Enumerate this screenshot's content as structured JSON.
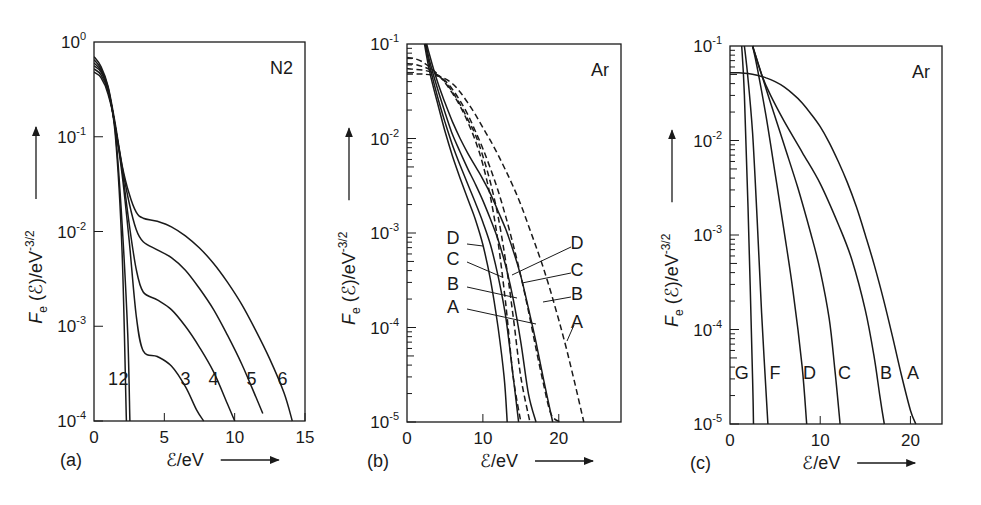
{
  "chart_data": [
    {
      "id": "a",
      "panel_label": "(a)",
      "type": "line",
      "title": "N2",
      "xlabel": "ℰ/eV",
      "ylabel": "Fe(ℰ)/eV^-3/2",
      "xscale": "linear",
      "yscale": "log",
      "xlim": [
        0,
        15
      ],
      "ylim": [
        0.0001,
        1
      ],
      "xticks": [
        0,
        5,
        10,
        15
      ],
      "xtick_labels": [
        "0",
        "5",
        "10",
        "15"
      ],
      "yticks": [
        1,
        0.1,
        0.01,
        0.001,
        0.0001
      ],
      "ytick_labels": [
        [
          "10",
          "0"
        ],
        [
          "10",
          "-1"
        ],
        [
          "10",
          "-2"
        ],
        [
          "10",
          "-3"
        ],
        [
          "10",
          "-4"
        ]
      ],
      "frame": {
        "x0": 94,
        "x1": 305,
        "y0": 42,
        "y1": 421
      },
      "series": [
        {
          "name": "1",
          "style": "solid",
          "label_pos": [
            1.35,
            0.00028
          ],
          "x": [
            0,
            0.5,
            1.0,
            1.5,
            2.0,
            2.3
          ],
          "y": [
            0.48,
            0.42,
            0.28,
            0.11,
            0.006,
            0.0001
          ]
        },
        {
          "name": "2",
          "style": "solid",
          "label_pos": [
            2.1,
            0.00028
          ],
          "x": [
            0,
            0.5,
            1.0,
            1.5,
            2.0,
            2.4,
            2.55
          ],
          "y": [
            0.52,
            0.45,
            0.3,
            0.12,
            0.012,
            0.0008,
            0.0001
          ]
        },
        {
          "name": "3",
          "style": "solid",
          "label_pos": [
            6.5,
            0.00028
          ],
          "x": [
            0,
            0.5,
            1.0,
            1.5,
            2.0,
            2.5,
            3.0,
            3.5,
            4.5,
            5.5,
            6.5,
            7.3,
            7.8
          ],
          "y": [
            0.56,
            0.48,
            0.31,
            0.13,
            0.04,
            0.008,
            0.0013,
            0.00055,
            0.00048,
            0.00038,
            0.00023,
            0.00013,
            0.0001
          ]
        },
        {
          "name": "4",
          "style": "solid",
          "label_pos": [
            8.5,
            0.00028
          ],
          "x": [
            0,
            0.5,
            1.0,
            1.5,
            2.0,
            2.5,
            3.0,
            3.5,
            4.5,
            5.5,
            6.5,
            7.5,
            8.5,
            9.5,
            10.0
          ],
          "y": [
            0.6,
            0.5,
            0.32,
            0.13,
            0.045,
            0.012,
            0.004,
            0.0023,
            0.0019,
            0.0015,
            0.001,
            0.0006,
            0.00033,
            0.00015,
            0.0001
          ]
        },
        {
          "name": "5",
          "style": "solid",
          "label_pos": [
            11.2,
            0.00028
          ],
          "x": [
            0,
            0.5,
            1.0,
            1.5,
            2.0,
            2.5,
            3.0,
            3.5,
            4.5,
            5.5,
            6.5,
            7.5,
            8.5,
            9.5,
            10.5,
            11.5,
            12.0
          ],
          "y": [
            0.65,
            0.52,
            0.33,
            0.13,
            0.048,
            0.02,
            0.0105,
            0.0078,
            0.0064,
            0.0053,
            0.0039,
            0.0025,
            0.0015,
            0.0008,
            0.0004,
            0.00018,
            0.00012
          ]
        },
        {
          "name": "6",
          "style": "solid",
          "label_pos": [
            13.4,
            0.00028
          ],
          "x": [
            0,
            0.5,
            1.0,
            1.5,
            2.0,
            2.5,
            3.0,
            3.5,
            4.5,
            5.5,
            6.5,
            7.5,
            8.5,
            9.5,
            10.5,
            11.5,
            12.5,
            13.5,
            14.1
          ],
          "y": [
            0.7,
            0.55,
            0.34,
            0.14,
            0.05,
            0.025,
            0.016,
            0.0138,
            0.0128,
            0.0112,
            0.009,
            0.0067,
            0.0046,
            0.0029,
            0.0017,
            0.0009,
            0.00045,
            0.0002,
            0.0001
          ]
        }
      ]
    },
    {
      "id": "b",
      "panel_label": "(b)",
      "type": "line",
      "title": "Ar",
      "xlabel": "ℰ/eV",
      "ylabel": "Fe(ℰ)/eV^-3/2",
      "xscale": "linear",
      "yscale": "log",
      "xlim": [
        0,
        28.2
      ],
      "ylim": [
        1e-05,
        0.1
      ],
      "xticks": [
        0,
        10,
        20
      ],
      "xtick_labels": [
        "0",
        "10",
        "20"
      ],
      "yticks": [
        0.1,
        0.01,
        0.001,
        0.0001,
        1e-05
      ],
      "ytick_labels": [
        [
          "10",
          "-1"
        ],
        [
          "10",
          "-2"
        ],
        [
          "10",
          "-3"
        ],
        [
          "10",
          "-4"
        ],
        [
          "10",
          "-5"
        ]
      ],
      "frame": {
        "x0": 407,
        "x1": 621,
        "y0": 44,
        "y1": 422
      },
      "series": [
        {
          "name": "D",
          "style": "solid",
          "label_side": "left",
          "x": [
            2.3,
            3.0,
            4.0,
            5.0,
            6.0,
            7.0,
            8.0,
            9.0,
            10.0,
            11.0,
            12.0,
            12.8,
            13.2
          ],
          "y": [
            0.1,
            0.05,
            0.024,
            0.012,
            0.0065,
            0.0038,
            0.0023,
            0.0014,
            0.00075,
            0.00032,
            0.0001,
            3e-05,
            1e-05
          ]
        },
        {
          "name": "C",
          "style": "solid",
          "label_side": "left",
          "x": [
            2.4,
            3.0,
            4.0,
            5.0,
            6.0,
            7.0,
            8.0,
            9.0,
            10.0,
            11.0,
            12.0,
            13.0,
            14.0,
            14.7
          ],
          "y": [
            0.1,
            0.058,
            0.028,
            0.015,
            0.0085,
            0.0052,
            0.0033,
            0.0021,
            0.0013,
            0.00075,
            0.00035,
            0.00013,
            3e-05,
            1e-05
          ]
        },
        {
          "name": "B",
          "style": "solid",
          "label_side": "left",
          "x": [
            2.5,
            3.0,
            4.0,
            5.0,
            6.0,
            7.0,
            8.0,
            9.0,
            10.0,
            11.0,
            12.0,
            13.0,
            14.0,
            15.0,
            16.0,
            17.0
          ],
          "y": [
            0.1,
            0.065,
            0.034,
            0.019,
            0.011,
            0.0072,
            0.0048,
            0.0033,
            0.0022,
            0.0014,
            0.00085,
            0.00045,
            0.0002,
            7e-05,
            2e-05,
            1e-05
          ]
        },
        {
          "name": "A",
          "style": "solid",
          "label_side": "left",
          "x": [
            2.6,
            3.0,
            4.0,
            5.0,
            6.0,
            7.0,
            8.0,
            9.0,
            10.0,
            11.0,
            12.0,
            13.0,
            14.0,
            15.0,
            16.0,
            17.0,
            18.0,
            19.2
          ],
          "y": [
            0.1,
            0.075,
            0.04,
            0.024,
            0.015,
            0.01,
            0.007,
            0.0051,
            0.0037,
            0.0026,
            0.0017,
            0.0011,
            0.00065,
            0.00035,
            0.00016,
            7e-05,
            2.8e-05,
            1e-05
          ]
        },
        {
          "name": "D",
          "style": "dashed",
          "label_side": "right",
          "x": [
            0,
            1,
            2,
            3,
            4,
            5,
            6,
            7,
            8,
            9,
            10,
            11,
            12,
            13,
            14,
            15
          ],
          "y": [
            0.072,
            0.07,
            0.065,
            0.057,
            0.048,
            0.039,
            0.03,
            0.022,
            0.015,
            0.0095,
            0.0053,
            0.0024,
            0.0008,
            0.00018,
            3e-05,
            1e-05
          ]
        },
        {
          "name": "C",
          "style": "dashed",
          "label_side": "right",
          "x": [
            0,
            1,
            2,
            3,
            4,
            5,
            6,
            7,
            8,
            9,
            10,
            11,
            12,
            13,
            14,
            15,
            16.2
          ],
          "y": [
            0.062,
            0.061,
            0.058,
            0.054,
            0.047,
            0.04,
            0.031,
            0.023,
            0.016,
            0.011,
            0.0065,
            0.0034,
            0.0015,
            0.0005,
            0.00013,
            3e-05,
            1e-05
          ]
        },
        {
          "name": "B",
          "style": "dashed",
          "label_side": "right",
          "x": [
            0,
            1,
            2,
            3,
            4,
            5,
            6,
            7,
            8,
            9,
            10,
            11,
            12,
            13,
            14,
            15,
            16,
            17,
            18,
            19,
            20.2
          ],
          "y": [
            0.055,
            0.054,
            0.053,
            0.051,
            0.047,
            0.041,
            0.033,
            0.025,
            0.018,
            0.012,
            0.0078,
            0.0048,
            0.0028,
            0.0015,
            0.00075,
            0.00035,
            0.00015,
            6e-05,
            2.5e-05,
            1.2e-05,
            1e-05
          ]
        },
        {
          "name": "A",
          "style": "dashed",
          "label_side": "right",
          "x": [
            0,
            2,
            4,
            5,
            6,
            7,
            8,
            9,
            10,
            11,
            12,
            13,
            14,
            15,
            16,
            17,
            18,
            19,
            20,
            21,
            22,
            23.3
          ],
          "y": [
            0.048,
            0.048,
            0.046,
            0.043,
            0.038,
            0.031,
            0.024,
            0.018,
            0.013,
            0.0095,
            0.0067,
            0.0046,
            0.0031,
            0.002,
            0.0012,
            0.00072,
            0.00042,
            0.00023,
            0.00012,
            6e-05,
            2.8e-05,
            1e-05
          ]
        }
      ],
      "annotations": [
        {
          "text": "D",
          "x": 453,
          "y": 244,
          "line": [
            467,
            244,
            483,
            246
          ]
        },
        {
          "text": "C",
          "x": 453,
          "y": 265,
          "line": [
            467,
            262,
            502,
            277
          ]
        },
        {
          "text": "B",
          "x": 453,
          "y": 290,
          "line": [
            467,
            287,
            517,
            298
          ]
        },
        {
          "text": "A",
          "x": 453,
          "y": 313,
          "line": [
            467,
            309,
            536,
            324
          ]
        },
        {
          "text": "D",
          "x": 577,
          "y": 249,
          "line": [
            571,
            247,
            512,
            275
          ]
        },
        {
          "text": "C",
          "x": 577,
          "y": 276,
          "line": [
            571,
            273,
            522,
            283
          ]
        },
        {
          "text": "B",
          "x": 577,
          "y": 300,
          "line": [
            571,
            297,
            543,
            302
          ]
        },
        {
          "text": "A",
          "x": 577,
          "y": 328,
          "line": [
            574,
            325,
            567,
            341
          ]
        }
      ]
    },
    {
      "id": "c",
      "panel_label": "(c)",
      "type": "line",
      "title": "Ar",
      "xlabel": "ℰ/eV",
      "ylabel": "Fe(ℰ)/eV^-3/2",
      "xscale": "linear",
      "yscale": "log",
      "xlim": [
        0,
        23.5
      ],
      "ylim": [
        1e-05,
        0.1
      ],
      "xticks": [
        0,
        10,
        20
      ],
      "xtick_labels": [
        "0",
        "10",
        "20"
      ],
      "yticks": [
        0.1,
        0.01,
        0.001,
        0.0001,
        1e-05
      ],
      "ytick_labels": [
        [
          "10",
          "-1"
        ],
        [
          "10",
          "-2"
        ],
        [
          "10",
          "-3"
        ],
        [
          "10",
          "-4"
        ],
        [
          "10",
          "-5"
        ]
      ],
      "frame": {
        "x0": 730,
        "x1": 942,
        "y0": 46,
        "y1": 424
      },
      "series": [
        {
          "name": "G",
          "style": "solid",
          "label_pos": [
            1.3,
            3.5e-05
          ],
          "x": [
            1.3,
            1.6,
            2.0,
            2.5,
            2.6
          ],
          "y": [
            0.1,
            0.03,
            0.002,
            3e-05,
            1e-05
          ]
        },
        {
          "name": "F",
          "style": "solid",
          "label_pos": [
            5.0,
            3.5e-05
          ],
          "x": [
            1.6,
            2.0,
            2.5,
            3.0,
            3.5,
            4.2
          ],
          "y": [
            0.1,
            0.045,
            0.012,
            0.0015,
            0.00015,
            1e-05
          ]
        },
        {
          "name": "D",
          "style": "solid",
          "label_pos": [
            8.8,
            3.5e-05
          ],
          "x": [
            2.5,
            3.0,
            4.0,
            5.0,
            6.0,
            7.0,
            8.0,
            8.5
          ],
          "y": [
            0.1,
            0.06,
            0.018,
            0.0045,
            0.0011,
            0.00025,
            4e-05,
            1e-05
          ]
        },
        {
          "name": "C",
          "style": "solid",
          "label_pos": [
            12.7,
            3.5e-05
          ],
          "x": [
            2.5,
            3.5,
            4.5,
            6.0,
            7.5,
            9.0,
            10.0,
            11.0,
            11.6,
            12.2
          ],
          "y": [
            0.1,
            0.05,
            0.025,
            0.009,
            0.0032,
            0.001,
            0.00042,
            0.00013,
            4e-05,
            1e-05
          ]
        },
        {
          "name": "B",
          "style": "solid",
          "label_pos": [
            17.3,
            3.5e-05
          ],
          "x": [
            2.5,
            3.5,
            4.5,
            6.0,
            8.0,
            10.0,
            12.0,
            13.5,
            15.0,
            16.0,
            16.6,
            17.1
          ],
          "y": [
            0.1,
            0.05,
            0.03,
            0.016,
            0.0075,
            0.0035,
            0.0013,
            0.00055,
            0.00016,
            5e-05,
            2e-05,
            1e-05
          ]
        },
        {
          "name": "A",
          "style": "solid",
          "label_pos": [
            20.3,
            3.5e-05
          ],
          "x": [
            0,
            1,
            2,
            3,
            4,
            5,
            6,
            7,
            8,
            9,
            10,
            11,
            12,
            13,
            14,
            15,
            16,
            17,
            18,
            19,
            20,
            20.6
          ],
          "y": [
            0.052,
            0.052,
            0.051,
            0.049,
            0.046,
            0.042,
            0.037,
            0.031,
            0.025,
            0.019,
            0.014,
            0.0095,
            0.006,
            0.0036,
            0.002,
            0.001,
            0.00048,
            0.00021,
            8.5e-05,
            3.3e-05,
            1.4e-05,
            1e-05
          ]
        }
      ]
    }
  ],
  "panels": {
    "a": {
      "label": "(a)",
      "title": "N2",
      "xlabel": "ℰ/eV",
      "ylabel_main": "F",
      "ylabel_sub": "e",
      "ylabel_rest": " (ℰ)/eV",
      "ylabel_sup": "-3/2"
    },
    "b": {
      "label": "(b)",
      "title": "Ar",
      "xlabel": "ℰ/eV",
      "ylabel_main": "F",
      "ylabel_sub": "e",
      "ylabel_rest": " (ℰ)/eV",
      "ylabel_sup": "-3/2"
    },
    "c": {
      "label": "(c)",
      "title": "Ar",
      "xlabel": "ℰ/eV",
      "ylabel_main": "F",
      "ylabel_sub": "e",
      "ylabel_rest": " (ℰ)/eV",
      "ylabel_sup": "-3/2"
    }
  }
}
